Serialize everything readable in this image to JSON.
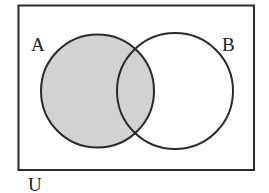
{
  "diagram": {
    "type": "venn",
    "universe": {
      "label": "U",
      "rect": {
        "x": 18.5,
        "y": 5.5,
        "width": 235.5,
        "height": 164.5
      }
    },
    "sets": [
      {
        "label": "A",
        "cx": 97.5,
        "cy": 91,
        "r": 56.5,
        "shaded": true
      },
      {
        "label": "B",
        "cx": 175,
        "cy": 91,
        "r": 58,
        "shaded": false
      }
    ],
    "shaded_region": "A",
    "colors": {
      "stroke": "#2a2a2a",
      "shade_fill": "#d2d2d2",
      "background": "#ffffff"
    }
  }
}
